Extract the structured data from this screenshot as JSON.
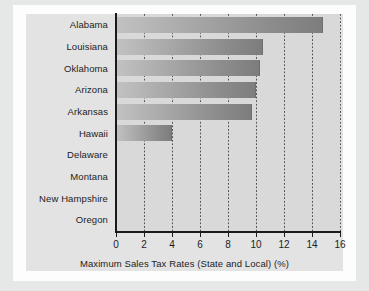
{
  "chart_data": {
    "type": "bar",
    "orientation": "horizontal",
    "title": "",
    "xlabel": "Maximum Sales Tax Rates (State and Local) (%)",
    "ylabel": "",
    "xlim": [
      0,
      16
    ],
    "xticks": [
      "0",
      "2",
      "4",
      "6",
      "8",
      "10",
      "12",
      "14",
      "16"
    ],
    "xtick_values": [
      0,
      2,
      4,
      6,
      8,
      10,
      12,
      14,
      16
    ],
    "grid": "vertical-dotted",
    "legend": "none",
    "categories": [
      "Alabama",
      "Louisiana",
      "Oklahoma",
      "Arizona",
      "Arkansas",
      "Hawaii",
      "Delaware",
      "Montana",
      "New Hampshire",
      "Oregon"
    ],
    "values": [
      14.8,
      10.5,
      10.3,
      10.0,
      9.7,
      4.0,
      0,
      0,
      0,
      0
    ],
    "series": [
      {
        "name": "Maximum Sales Tax Rates (State and Local) (%)",
        "values": [
          14.8,
          10.5,
          10.3,
          10.0,
          9.7,
          4.0,
          0,
          0,
          0,
          0
        ]
      }
    ]
  },
  "colors": {
    "page_background": "#e6e7e7",
    "frame": "#fdfdfd",
    "canvas": "#e3e3e3",
    "plot_background": "#d9d9d9",
    "bar_light": "#c2c2c2",
    "bar_dark": "#7d7d7d",
    "axis": "#1a1a1a",
    "text": "#1d1d1d"
  }
}
